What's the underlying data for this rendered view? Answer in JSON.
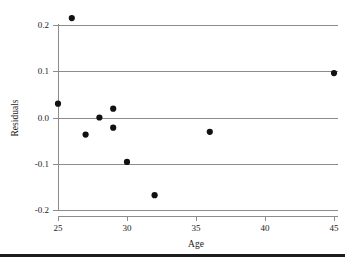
{
  "chart_data": {
    "type": "scatter",
    "title": "",
    "xlabel": "Age",
    "ylabel": "Residuals",
    "xlim": [
      24.0,
      45.8
    ],
    "ylim": [
      -0.215,
      0.235
    ],
    "grid": true,
    "legend": null,
    "xticks": [
      25,
      30,
      35,
      40,
      45
    ],
    "xticklabels": [
      "25",
      "30",
      "35",
      "40",
      "45"
    ],
    "yticks": [
      0.2,
      0.1,
      0.0,
      -0.1,
      -0.2
    ],
    "yticklabels": [
      "0.2",
      "0.1",
      "0.0",
      "-0.1",
      "-0.2"
    ],
    "x": [
      25,
      26,
      27,
      28,
      29,
      29,
      30,
      32,
      36,
      45
    ],
    "y": [
      0.03,
      0.215,
      -0.037,
      0.0,
      0.019,
      -0.022,
      -0.096,
      -0.168,
      -0.031,
      0.096
    ],
    "points": [
      {
        "x": 25,
        "y": 0.03
      },
      {
        "x": 26,
        "y": 0.215
      },
      {
        "x": 27,
        "y": -0.037
      },
      {
        "x": 28,
        "y": 0.0
      },
      {
        "x": 29,
        "y": 0.019
      },
      {
        "x": 29,
        "y": -0.022
      },
      {
        "x": 30,
        "y": -0.096
      },
      {
        "x": 32,
        "y": -0.168
      },
      {
        "x": 36,
        "y": -0.031
      },
      {
        "x": 45,
        "y": 0.096
      }
    ],
    "marker": "circle",
    "marker_color": "#111111",
    "gridline_color": "#8c8c8c"
  },
  "labels": {
    "x_axis_title": "Age",
    "y_axis_title": "Residuals"
  }
}
